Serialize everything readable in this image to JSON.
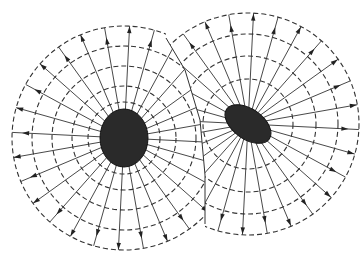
{
  "diagram": {
    "title": "",
    "colors": {
      "background": "#ffffff",
      "line": "#333333",
      "body": "#2a2a2a"
    },
    "bodies": [
      {
        "name": "left-body",
        "cx": 124,
        "cy": 138,
        "rx": 24,
        "ry": 29,
        "rings": [
          36,
          52,
          72,
          92,
          112
        ],
        "rays": 28,
        "field_direction": "outward"
      },
      {
        "name": "right-body",
        "cx": 248,
        "cy": 124,
        "rx": 26,
        "ry": 15,
        "rotate": 35,
        "rings": [
          45,
          68,
          90,
          111
        ],
        "rays": 28,
        "field_direction": "outward"
      }
    ],
    "boundary": [
      [
        166,
        38
      ],
      [
        185,
        70
      ],
      [
        200,
        120
      ],
      [
        205,
        175
      ],
      [
        205,
        224
      ]
    ]
  }
}
